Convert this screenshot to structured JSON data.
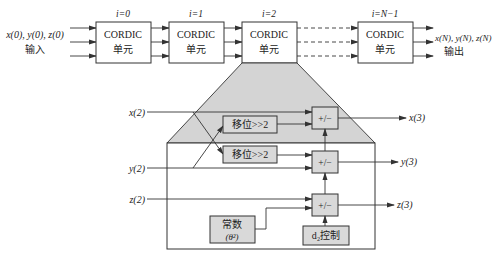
{
  "top": {
    "input_label": "x(0), y(0), z(0)",
    "input_caption": "输入",
    "output_label": "x(N), y(N), z(N)",
    "output_caption": "输出",
    "stages": [
      {
        "index_label": "i=0",
        "line1": "CORDIC",
        "line2": "单元"
      },
      {
        "index_label": "i=1",
        "line1": "CORDIC",
        "line2": "单元"
      },
      {
        "index_label": "i=2",
        "line1": "CORDIC",
        "line2": "单元"
      },
      {
        "index_label": "i=N−1",
        "line1": "CORDIC",
        "line2": "单元"
      }
    ]
  },
  "detail": {
    "inputs": {
      "x": "x(2)",
      "y": "y(2)",
      "z": "z(2)"
    },
    "outputs": {
      "x": "x(3)",
      "y": "y(3)",
      "z": "z(3)"
    },
    "shift1": "移位>>2",
    "shift2": "移位>>2",
    "addsub": [
      "+/−",
      "+/−",
      "+/−"
    ],
    "const_line1": "常数",
    "const_line2": "(θ²)",
    "control": "d₂控制"
  }
}
